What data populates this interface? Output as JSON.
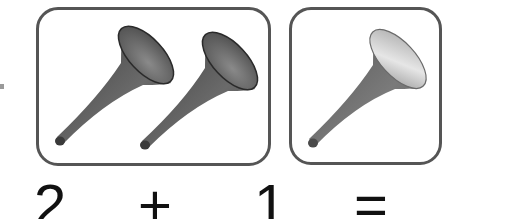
{
  "equation": {
    "group_a": {
      "count": 2,
      "item": "vuvuzela-horn",
      "label": "2"
    },
    "operator": "+",
    "group_b": {
      "count": 1,
      "item": "vuvuzela-horn",
      "label": "1"
    },
    "equals": "="
  },
  "colors": {
    "frame_border": "#555555",
    "horn_dark": "#5a5a5a",
    "horn_light": "#bdbdbd",
    "text": "#111111"
  }
}
